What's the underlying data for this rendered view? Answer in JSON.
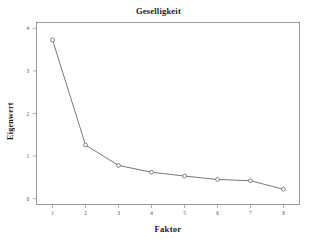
{
  "chart_data": {
    "type": "line",
    "title": "Geselligkeit",
    "xlabel": "Faktor",
    "ylabel": "Eigenwert",
    "x": [
      1,
      2,
      3,
      4,
      5,
      6,
      7,
      8
    ],
    "categories": [
      "1",
      "2",
      "3",
      "4",
      "5",
      "6",
      "7",
      "8"
    ],
    "values": [
      3.73,
      1.26,
      0.78,
      0.62,
      0.53,
      0.45,
      0.42,
      0.22
    ],
    "series": [
      {
        "name": "Eigenwert",
        "values": [
          3.73,
          1.26,
          0.78,
          0.62,
          0.53,
          0.45,
          0.42,
          0.22
        ]
      }
    ],
    "xlim": [
      0.5,
      8.5
    ],
    "ylim": [
      -0.15,
      4.15
    ],
    "x_ticks": [
      1,
      2,
      3,
      4,
      5,
      6,
      7,
      8
    ],
    "x_tick_labels": [
      "1",
      "2",
      "3",
      "4",
      "5",
      "6",
      "7",
      "8"
    ],
    "y_ticks": [
      0,
      1,
      2,
      3,
      4
    ],
    "y_tick_labels": [
      "0",
      "1",
      "2",
      "3",
      "4"
    ],
    "grid": false,
    "legend": "none",
    "marker": "open-circle",
    "line_color": "#555555",
    "marker_color": "#666666",
    "frame_color": "#9a9a9a",
    "background": "#ffffff"
  }
}
